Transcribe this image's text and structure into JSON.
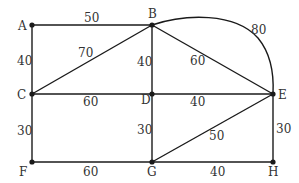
{
  "diagram": {
    "type": "weighted-graph",
    "nodes": [
      {
        "id": "A",
        "label": "A",
        "x": 32,
        "y": 25
      },
      {
        "id": "B",
        "label": "B",
        "x": 152,
        "y": 25
      },
      {
        "id": "C",
        "label": "C",
        "x": 32,
        "y": 94
      },
      {
        "id": "D",
        "label": "D",
        "x": 152,
        "y": 94
      },
      {
        "id": "E",
        "label": "E",
        "x": 273,
        "y": 94
      },
      {
        "id": "F",
        "label": "F",
        "x": 32,
        "y": 162
      },
      {
        "id": "G",
        "label": "G",
        "x": 152,
        "y": 162
      },
      {
        "id": "H",
        "label": "H",
        "x": 273,
        "y": 162
      }
    ],
    "edges": [
      {
        "from": "A",
        "to": "B",
        "weight": "50"
      },
      {
        "from": "A",
        "to": "C",
        "weight": "40"
      },
      {
        "from": "B",
        "to": "C",
        "weight": "70"
      },
      {
        "from": "B",
        "to": "D",
        "weight": "40"
      },
      {
        "from": "B",
        "to": "E",
        "weight": "60"
      },
      {
        "from": "B",
        "to": "E",
        "weight": "80",
        "curved": true
      },
      {
        "from": "C",
        "to": "D",
        "weight": "60"
      },
      {
        "from": "D",
        "to": "E",
        "weight": "40"
      },
      {
        "from": "C",
        "to": "F",
        "weight": "30"
      },
      {
        "from": "D",
        "to": "G",
        "weight": "30"
      },
      {
        "from": "E",
        "to": "G",
        "weight": "50"
      },
      {
        "from": "E",
        "to": "H",
        "weight": "30"
      },
      {
        "from": "F",
        "to": "G",
        "weight": "60"
      },
      {
        "from": "G",
        "to": "H",
        "weight": "40"
      }
    ]
  }
}
